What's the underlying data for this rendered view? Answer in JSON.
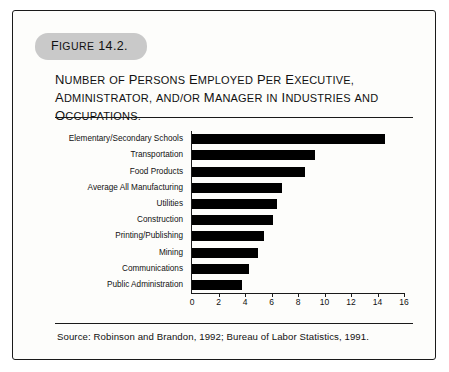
{
  "figure": {
    "tag_label": "Figure 14.2.",
    "title": "Number of Persons Employed Per Executive, Administrator, and/or Manager in Industries and Occupations.",
    "source": "Source: Robinson and Brandon, 1992; Bureau of Labor Statistics, 1991."
  },
  "colors": {
    "bar": "#000000",
    "tag_background": "#c9c9c9",
    "border": "#1a1a1a",
    "card_background": "#fdfdfb"
  },
  "chart_data": {
    "type": "bar",
    "orientation": "horizontal",
    "title": "Number of Persons Employed Per Executive, Administrator, and/or Manager in Industries and Occupations.",
    "xlabel": "",
    "ylabel": "",
    "xlim": [
      0,
      16
    ],
    "xticks": [
      0,
      2,
      4,
      6,
      8,
      10,
      12,
      14,
      16
    ],
    "grid": false,
    "legend": false,
    "categories": [
      "Elementary/Secondary Schools",
      "Transportation",
      "Food Products",
      "Average All Manufacturing",
      "Utilities",
      "Construction",
      "Printing/Publishing",
      "Mining",
      "Communications",
      "Public Administration"
    ],
    "values": [
      14.6,
      9.3,
      8.5,
      6.8,
      6.4,
      6.1,
      5.4,
      5.0,
      4.3,
      3.8
    ]
  }
}
